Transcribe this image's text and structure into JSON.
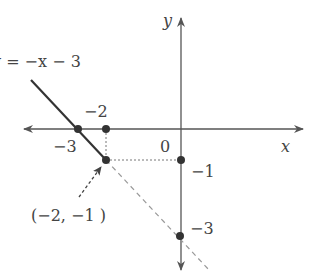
{
  "diagram": {
    "equation_label": "y = −x − 3",
    "axes": {
      "x_label": "x",
      "y_label": "y",
      "origin_label": "0"
    },
    "tick_labels": {
      "x_neg3": "−3",
      "x_neg2": "−2",
      "y_neg1": "−1",
      "y_neg3": "−3"
    },
    "point_annotation": "(−2, −1 )",
    "points": [
      {
        "name": "x-intercept",
        "x": -3,
        "y": 0
      },
      {
        "name": "x-minus-2",
        "x": -2,
        "y": 0
      },
      {
        "name": "highlight-point",
        "x": -2,
        "y": -1
      },
      {
        "name": "y-minus-1",
        "x": 0,
        "y": -1
      },
      {
        "name": "y-intercept",
        "x": 0,
        "y": -3
      }
    ],
    "colors": {
      "axis": "#555555",
      "line": "#333333",
      "dashed": "#888888",
      "point": "#333333"
    }
  }
}
